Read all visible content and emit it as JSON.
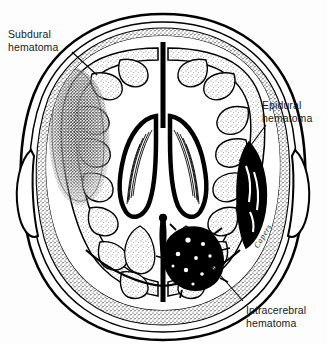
{
  "figure": {
    "style": "black-and-white line drawing, stippled shading",
    "background_color": "#fdfdfd",
    "ink_color": "#000000",
    "signature": "Capers"
  },
  "labels": [
    {
      "id": "subdural",
      "text": "Subdural\nhematoma",
      "line1": "Subdural",
      "line2": "hematoma",
      "position": "upper-left",
      "leader_from": [
        72,
        52
      ],
      "leader_to": [
        96,
        74
      ]
    },
    {
      "id": "epidural",
      "text": "Epidural\nhematoma",
      "line1": "Epidural",
      "line2": "hematoma",
      "position": "right",
      "leader_from": [
        266,
        124
      ],
      "leader_to": [
        238,
        160
      ]
    },
    {
      "id": "intracerebral",
      "text": "Intracerebral\nhematoma",
      "line1": "Intracerebral",
      "line2": "hematoma",
      "position": "lower-right",
      "leader_from": [
        243,
        300
      ],
      "leader_to": [
        205,
        258
      ]
    }
  ],
  "anatomy": {
    "skull_layers": [
      "outer table",
      "diploe",
      "inner table",
      "dura mater"
    ],
    "structures": [
      "frontal lobes",
      "falx cerebri",
      "lateral ventricles",
      "choroid plexus",
      "third ventricle",
      "occipital lobes",
      "cerebral gyri and sulci"
    ]
  },
  "findings": [
    {
      "name": "Subdural hematoma",
      "location": "left frontoparietal convexity",
      "shape": "crescent-shaped (concave)",
      "rendering": "dense stipple"
    },
    {
      "name": "Epidural hematoma",
      "location": "right temporal region",
      "shape": "biconvex lens-shaped",
      "rendering": "solid black"
    },
    {
      "name": "Intracerebral hematoma",
      "location": "right occipital lobe",
      "shape": "irregular clot",
      "rendering": "solid black with mottled edges"
    }
  ]
}
